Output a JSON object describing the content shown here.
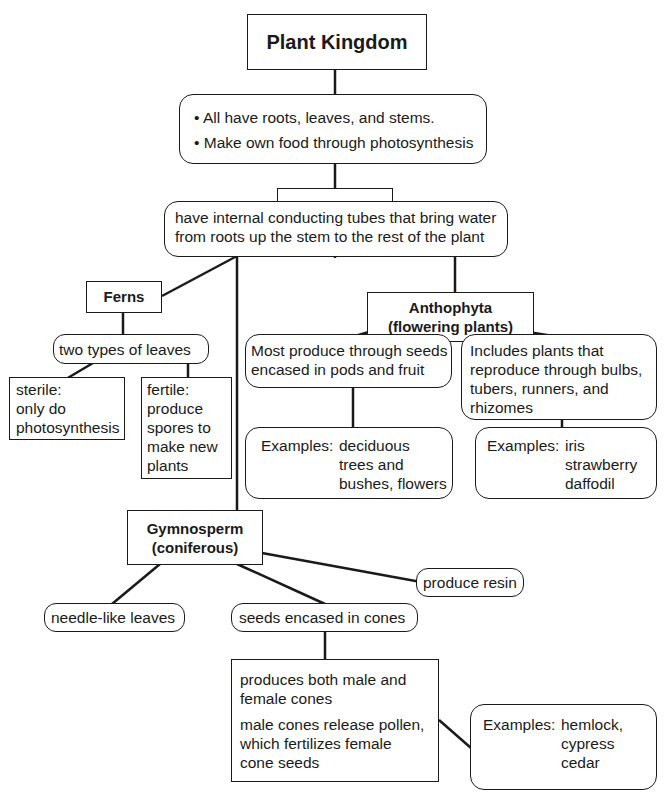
{
  "diagram": {
    "root": {
      "label": "Plant Kingdom"
    },
    "root_facts": [
      "All have roots, leaves, and stems.",
      "Make own food through photosynthesis"
    ],
    "vascular": {
      "label": "Vascular",
      "description": [
        "have internal conducting tubes that bring water",
        "from roots up the stem to the rest of the plant"
      ]
    },
    "ferns": {
      "label": "Ferns",
      "leaves": "two types of leaves",
      "sterile": [
        "sterile:",
        "only do",
        "photosynthesis"
      ],
      "fertile": [
        "fertile:",
        "produce",
        "spores to",
        "make new",
        "plants"
      ]
    },
    "anthophyta": {
      "label_line1": "Anthophyta",
      "label_line2": "(flowering plants)",
      "seeds": [
        "Most produce through seeds",
        "encased in pods and fruit"
      ],
      "seeds_examples_label": "Examples:",
      "seeds_examples": [
        "deciduous",
        "trees and",
        "bushes, flowers"
      ],
      "bulbs": [
        "Includes plants that",
        "reproduce through bulbs,",
        "tubers, runners, and",
        "rhizomes"
      ],
      "bulbs_examples_label": "Examples:",
      "bulbs_examples": [
        "iris",
        "strawberry",
        "daffodil"
      ]
    },
    "gymnosperm": {
      "label_line1": "Gymnosperm",
      "label_line2": "(coniferous)",
      "resin": "produce resin",
      "needles": "needle-like leaves",
      "cones": "seeds encased in cones",
      "cone_facts_1": [
        "produces both male and",
        "female cones"
      ],
      "cone_facts_2": [
        "male cones release pollen,",
        "which fertilizes female",
        "cone seeds"
      ],
      "examples_label": "Examples:",
      "examples": [
        "hemlock,",
        "cypress",
        "cedar"
      ]
    }
  }
}
